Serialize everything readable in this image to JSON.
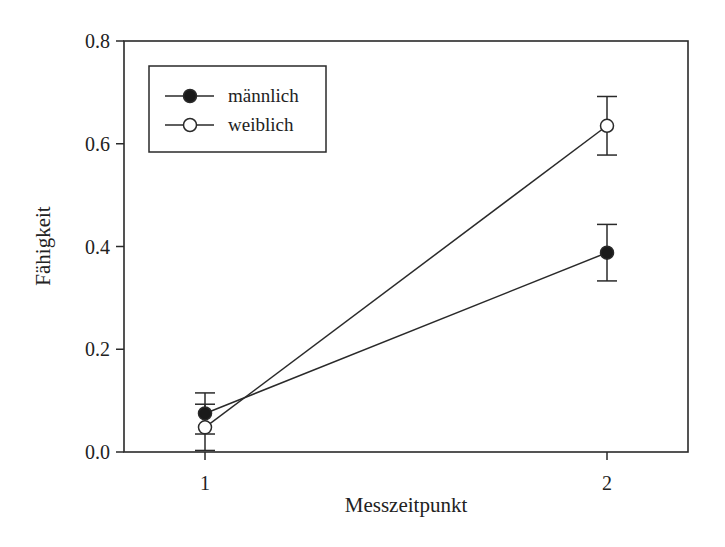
{
  "chart_data": {
    "type": "line",
    "title": "",
    "xlabel": "Messzeitpunkt",
    "ylabel": "Fähigkeit",
    "x": [
      1,
      2
    ],
    "xticks": [
      "1",
      "2"
    ],
    "yticks": [
      "0.0",
      "0.2",
      "0.4",
      "0.6",
      "0.8"
    ],
    "ylim": [
      0,
      0.8
    ],
    "grid": false,
    "legend_position": "upper left",
    "series": [
      {
        "name": "männlich",
        "marker": "filled-circle",
        "values": [
          0.075,
          0.388
        ],
        "error": [
          0.04,
          0.055
        ]
      },
      {
        "name": "weiblich",
        "marker": "open-circle",
        "values": [
          0.048,
          0.635
        ],
        "error": [
          0.045,
          0.057
        ]
      }
    ]
  },
  "colors": {
    "line": "#2a2a2a",
    "marker_filled": "#1a1a1a",
    "marker_open": "#ffffff",
    "background": "#ffffff"
  }
}
